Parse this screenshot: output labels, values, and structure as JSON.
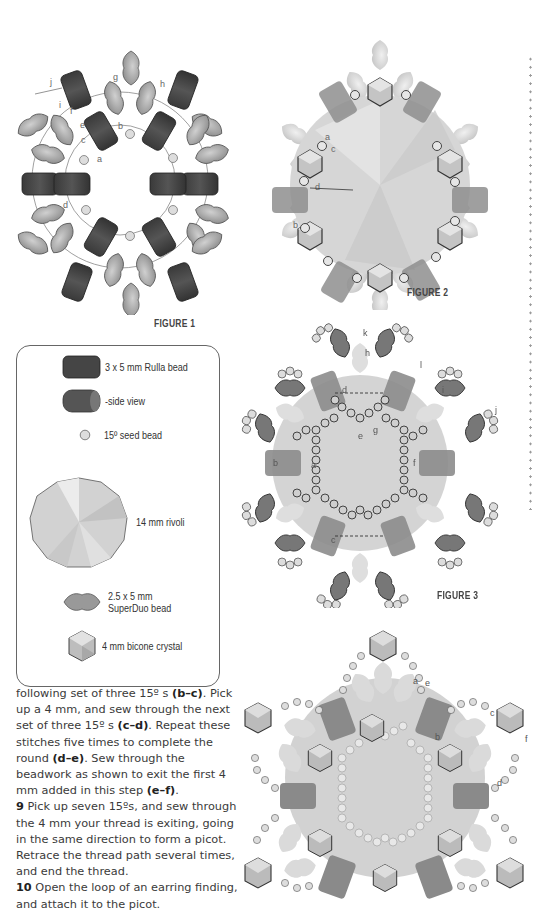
{
  "figures": [
    {
      "id": "figure-1",
      "label": "FIGURE 1",
      "path_labels": [
        "a",
        "b",
        "c",
        "d",
        "e",
        "f",
        "g",
        "h",
        "i",
        "j"
      ]
    },
    {
      "id": "figure-2",
      "label": "FIGURE 2",
      "path_labels": [
        "a",
        "b",
        "c",
        "d"
      ]
    },
    {
      "id": "figure-3",
      "label": "FIGURE 3",
      "path_labels": [
        "a",
        "b",
        "c",
        "d",
        "e",
        "f",
        "g",
        "h",
        "i",
        "j",
        "k",
        "l"
      ]
    },
    {
      "id": "figure-4",
      "label": "",
      "path_labels": [
        "a",
        "b",
        "c",
        "d",
        "e",
        "f"
      ]
    }
  ],
  "legend": {
    "items": [
      {
        "name": "rulla-bead",
        "label": "3 x 5 mm Rulla bead"
      },
      {
        "name": "rulla-side-view",
        "label": "-side view"
      },
      {
        "name": "seed-bead",
        "label": "15º seed bead"
      },
      {
        "name": "rivoli",
        "label": "14 mm rivoli"
      },
      {
        "name": "superduo-bead",
        "label_line1": "2.5 x 5 mm",
        "label_line2": "SuperDuo bead"
      },
      {
        "name": "bicone-crystal",
        "label": "4 mm bicone crystal"
      }
    ]
  },
  "instructions": {
    "continued": {
      "t1": "following set of three 15º s ",
      "b1": "(b–c)",
      "t2": ". Pick up a 4 mm, and sew through the next set of three 15º s ",
      "b2": "(c–d)",
      "t3": ". Repeat these stitches five times to complete the round ",
      "b3": "(d–e)",
      "t4": ". Sew through the beadwork as shown to exit the first 4 mm added in this step ",
      "b4": "(e–f)",
      "t5": "."
    },
    "steps": [
      {
        "number": "9",
        "text": " Pick up seven 15ºs, and sew through the 4 mm your thread is exiting, going in the same direction to form a picot. Retrace the thread path several times, and end the thread."
      },
      {
        "number": "10",
        "text": " Open the loop of an earring finding, and attach it to the picot."
      }
    ]
  },
  "colors": {
    "rulla": "#4a4a4a",
    "superduo": "#a8a8a8",
    "rivoli": "#d4d4d4",
    "seed": "#d8d8d8",
    "bicone": "#b5b5b5",
    "text": "#3a3a3a",
    "dotted_rule": "#9a9a9a"
  }
}
